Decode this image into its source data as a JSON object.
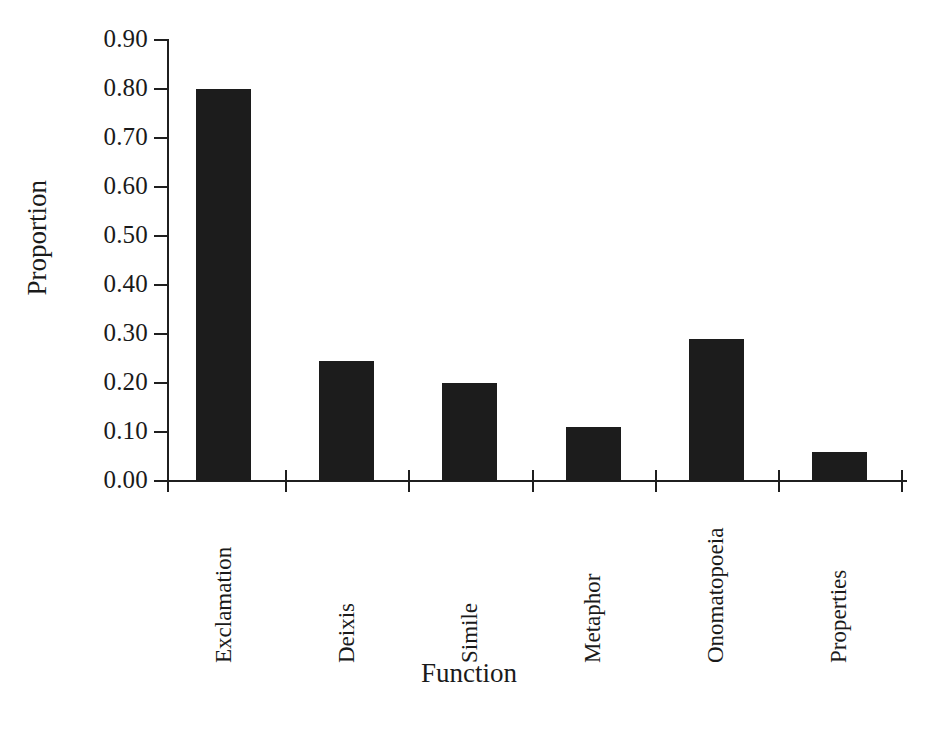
{
  "chart_data": {
    "type": "bar",
    "title": "",
    "subtitle": "",
    "xlabel": "Function",
    "ylabel": "Proportion",
    "categories": [
      "Exclamation",
      "Deixis",
      "Simile",
      "Metaphor",
      "Onomatopoeia",
      "Properties"
    ],
    "values": [
      0.8,
      0.245,
      0.2,
      0.11,
      0.29,
      0.06
    ],
    "series": [
      {
        "name": "Proportion",
        "values": [
          0.8,
          0.245,
          0.2,
          0.11,
          0.29,
          0.06
        ]
      }
    ],
    "ylim": [
      0.0,
      0.9
    ],
    "ytick_labels": [
      "0.90",
      "0.80",
      "0.70",
      "0.60",
      "0.50",
      "0.40",
      "0.30",
      "0.20",
      "0.10",
      "0.00"
    ],
    "ytick_values": [
      0.9,
      0.8,
      0.7,
      0.6,
      0.5,
      0.4,
      0.3,
      0.2,
      0.1,
      0.0
    ],
    "grid": false,
    "legend": false,
    "legend_position": "none",
    "bar_color": "#1c1c1c",
    "axis_color": "#1f1f1f",
    "background_color": "#ffffff",
    "annotations": []
  }
}
